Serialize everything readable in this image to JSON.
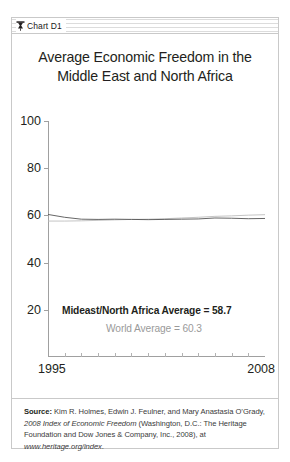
{
  "header": {
    "icon": "chart-pin-icon",
    "label": "Chart D1"
  },
  "chart_data": {
    "type": "line",
    "title": "Average Economic Freedom in the Middle East and North Africa",
    "xlabel": "",
    "ylabel": "",
    "xlim": [
      1995,
      2008
    ],
    "ylim": [
      0,
      100
    ],
    "grid": false,
    "legend": "none",
    "x": [
      1995,
      1996,
      1997,
      1998,
      1999,
      2000,
      2001,
      2002,
      2003,
      2004,
      2005,
      2006,
      2007,
      2008
    ],
    "series": [
      {
        "name": "Mideast/North Africa Average",
        "color": "#555555",
        "values": [
          60.4,
          59.2,
          58.4,
          58.3,
          58.4,
          58.3,
          58.2,
          58.3,
          58.4,
          58.5,
          58.9,
          58.8,
          58.6,
          58.7
        ]
      },
      {
        "name": "World Average",
        "color": "#bdbdbd",
        "values": [
          57.6,
          57.6,
          57.7,
          57.9,
          58.1,
          58.3,
          58.4,
          58.6,
          58.9,
          59.2,
          59.6,
          59.8,
          60.1,
          60.3
        ]
      }
    ],
    "yticks": [
      100,
      80,
      60,
      40,
      20
    ],
    "xticks": [
      1995,
      1996,
      1997,
      1998,
      1999,
      2000,
      2001,
      2002,
      2003,
      2004,
      2005,
      2006,
      2007,
      2008
    ],
    "xtick_labels_shown": [
      "1995",
      "2008"
    ],
    "annotations": [
      {
        "id": "region-average",
        "text": "Mideast/North Africa Average = 58.7",
        "color": "#231f20",
        "bold": true
      },
      {
        "id": "world-average",
        "text": "World Average = 60.3",
        "color": "#9a9a9a",
        "bold": false
      }
    ]
  },
  "source": {
    "label": "Source:",
    "line1_rest": " Kim R. Holmes, Edwin J. Feulner, and Mary Anastasia",
    "line2_pre": "O’Grady, ",
    "line2_italic": "2008 Index of Economic Freedom",
    "line2_post": " (Washington, D.C.:",
    "line3": "The Heritage Foundation and Dow Jones & Company, Inc., 2008),",
    "line4_pre": "at ",
    "line4_italic": "www.heritage.org/index",
    "line4_post": "."
  }
}
